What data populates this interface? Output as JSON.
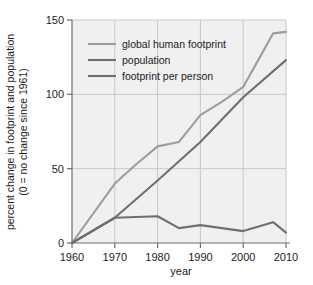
{
  "chart_data": {
    "type": "line",
    "title": "",
    "xlabel": "year",
    "ylabel_line1": "percent change in footprint and population",
    "ylabel_line2": "(0 = no change since 1961)",
    "xlim": [
      1960,
      2010
    ],
    "ylim": [
      0,
      150
    ],
    "xticks": [
      1960,
      1970,
      1980,
      1990,
      2000,
      2010
    ],
    "xtick_labels": [
      "1960",
      "1970",
      "1980",
      "1990",
      "2000",
      "2010"
    ],
    "yticks": [
      0,
      50,
      100,
      150
    ],
    "ytick_labels": [
      "0",
      "50",
      "100",
      "150"
    ],
    "grid": true,
    "legend_position": "upper-left-inside",
    "panel_color": "#f0f0f0",
    "grid_color": "#c8c8c8",
    "axis_color": "#6e6e6e",
    "series": [
      {
        "name": "global human footprint",
        "color": "#9d9d9d",
        "x": [
          1960,
          1970,
          1975,
          1980,
          1985,
          1990,
          1995,
          2000,
          2007,
          2010
        ],
        "values": [
          0,
          40,
          53,
          65,
          68,
          86,
          95,
          105,
          141,
          142
        ]
      },
      {
        "name": "population",
        "color": "#6f6f6f",
        "x": [
          1960,
          1970,
          1980,
          1990,
          2000,
          2010
        ],
        "values": [
          0,
          17,
          42,
          68,
          98,
          123
        ]
      },
      {
        "name": "footprint per person",
        "color": "#6f6f6f",
        "x": [
          1960,
          1970,
          1980,
          1985,
          1990,
          1995,
          2000,
          2007,
          2010
        ],
        "values": [
          0,
          17,
          18,
          10,
          12,
          10,
          8,
          14,
          7
        ]
      }
    ]
  },
  "legend": {
    "entries": [
      {
        "label": "global human footprint",
        "color": "#9d9d9d"
      },
      {
        "label": "population",
        "color": "#6f6f6f"
      },
      {
        "label": "footprint per person",
        "color": "#6f6f6f"
      }
    ]
  }
}
